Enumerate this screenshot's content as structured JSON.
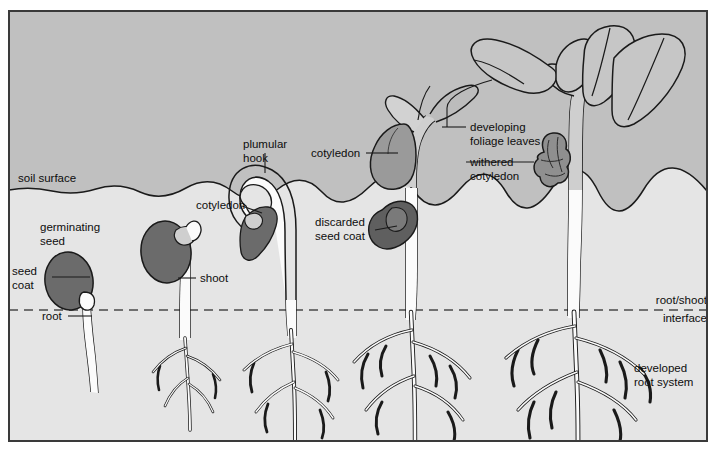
{
  "figure": {
    "frame": {
      "x": 8,
      "y": 10,
      "width": 700,
      "height": 432,
      "border_color": "#3a3a3a"
    },
    "regions": {
      "sky": {
        "label": "above-ground air region",
        "color": "#c0c0c0",
        "top": 10,
        "bottom": 190
      },
      "soil": {
        "label": "below-ground soil region",
        "color": "#e5e5e5",
        "top": 190,
        "bottom": 442
      }
    },
    "colors": {
      "sky": "#c0c0c0",
      "soil": "#e5e5e5",
      "seed_coat_dark": "#6b6b6b",
      "cotyledon_mid": "#9a9a9a",
      "plant_fill": "#fbfbfb",
      "outline": "#1a1a1a",
      "text": "#0d0d0d",
      "page_background": "#ffffff"
    },
    "lines": {
      "soil_surface": {
        "name": "soil surface boundary",
        "style": "wavy solid",
        "y": 190
      },
      "root_shoot_interface": {
        "name": "root/shoot interface",
        "style": "dashed",
        "y": 310
      }
    }
  },
  "labels": [
    {
      "id": "soil-surface",
      "text": "soil surface",
      "x": 18,
      "y": 182,
      "anchor": "start",
      "lines": [
        "soil surface"
      ]
    },
    {
      "id": "germinating-seed",
      "text": "germinating seed",
      "x": 40,
      "y": 231,
      "anchor": "start",
      "lines": [
        "germinating",
        "seed"
      ]
    },
    {
      "id": "seed-coat",
      "text": "seed coat",
      "x": 12,
      "y": 275,
      "anchor": "start",
      "lines": [
        "seed",
        "coat"
      ]
    },
    {
      "id": "root",
      "text": "root",
      "x": 42,
      "y": 320,
      "anchor": "start",
      "lines": [
        "root"
      ]
    },
    {
      "id": "shoot",
      "text": "shoot",
      "x": 200,
      "y": 282,
      "anchor": "start",
      "lines": [
        "shoot"
      ]
    },
    {
      "id": "plumular-hook",
      "text": "plumular hook",
      "x": 243,
      "y": 148,
      "anchor": "start",
      "lines": [
        "plumular",
        "hook"
      ]
    },
    {
      "id": "cotyledon-stage3",
      "text": "cotyledon",
      "x": 196,
      "y": 209,
      "anchor": "start",
      "lines": [
        "cotyledon"
      ]
    },
    {
      "id": "cotyledon-stage4",
      "text": "cotyledon",
      "x": 311,
      "y": 157,
      "anchor": "start",
      "lines": [
        "cotyledon"
      ]
    },
    {
      "id": "discarded-seed-coat",
      "text": "discarded seed coat",
      "x": 315,
      "y": 226,
      "anchor": "start",
      "lines": [
        "discarded",
        "seed coat"
      ]
    },
    {
      "id": "developing-leaves",
      "text": "developing foliage leaves",
      "x": 470,
      "y": 131,
      "anchor": "start",
      "lines": [
        "developing",
        "foliage leaves"
      ]
    },
    {
      "id": "withered-cotyledon",
      "text": "withered cotyledon",
      "x": 470,
      "y": 166,
      "anchor": "start",
      "lines": [
        "withered",
        "cotyledon"
      ]
    },
    {
      "id": "root-shoot-interface",
      "text": "root/shoot interface",
      "x": 707,
      "y": 304,
      "anchor": "end",
      "lines": [
        "root/shoot",
        "interface"
      ]
    },
    {
      "id": "developed-root-system",
      "text": "developed root system",
      "x": 634,
      "y": 372,
      "anchor": "start",
      "lines": [
        "developed",
        "root system"
      ]
    }
  ],
  "stages": [
    {
      "index": 1,
      "name": "germinating-seed-stage",
      "description": "seed with coat and emerging root"
    },
    {
      "index": 2,
      "name": "shoot-emergence-stage",
      "description": "seed with shoot and branching root"
    },
    {
      "index": 3,
      "name": "plumular-hook-stage",
      "description": "hooked shoot breaking soil surface with cotyledon"
    },
    {
      "index": 4,
      "name": "cotyledon-expansion-stage",
      "description": "cotyledon above soil, discarded seed coat, first leaves"
    },
    {
      "index": 5,
      "name": "foliage-leaf-stage",
      "description": "developed foliage leaves, withered cotyledon, developed root system"
    }
  ]
}
